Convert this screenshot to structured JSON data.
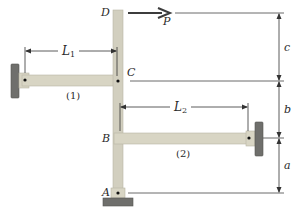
{
  "diagram": {
    "type": "structural-mechanics",
    "points": {
      "A": "A",
      "B": "B",
      "C": "C",
      "D": "D"
    },
    "load": {
      "label": "P",
      "direction": "right"
    },
    "members": {
      "link1": {
        "label": "(1)",
        "length_label": "L",
        "length_sub": "1"
      },
      "link2": {
        "label": "(2)",
        "length_label": "L",
        "length_sub": "2"
      }
    },
    "dimensions": {
      "a": "a",
      "b": "b",
      "c": "c"
    },
    "colors": {
      "member_fill": "#d8d5c4",
      "member_edge": "#b9b6a5",
      "support_fill": "#6f6f6c",
      "support_edge": "#555553",
      "line": "#333333",
      "arrow": "#3c3c3c"
    }
  }
}
